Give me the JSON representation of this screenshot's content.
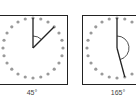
{
  "panels": [
    {
      "label": "45°",
      "angle_deg": 45,
      "dots": 24
    },
    {
      "label": "165°",
      "angle_deg": 165,
      "dots": 24
    }
  ],
  "colors": {
    "dot": "#9a9a9a",
    "line": "#222222",
    "border": "#222222"
  }
}
